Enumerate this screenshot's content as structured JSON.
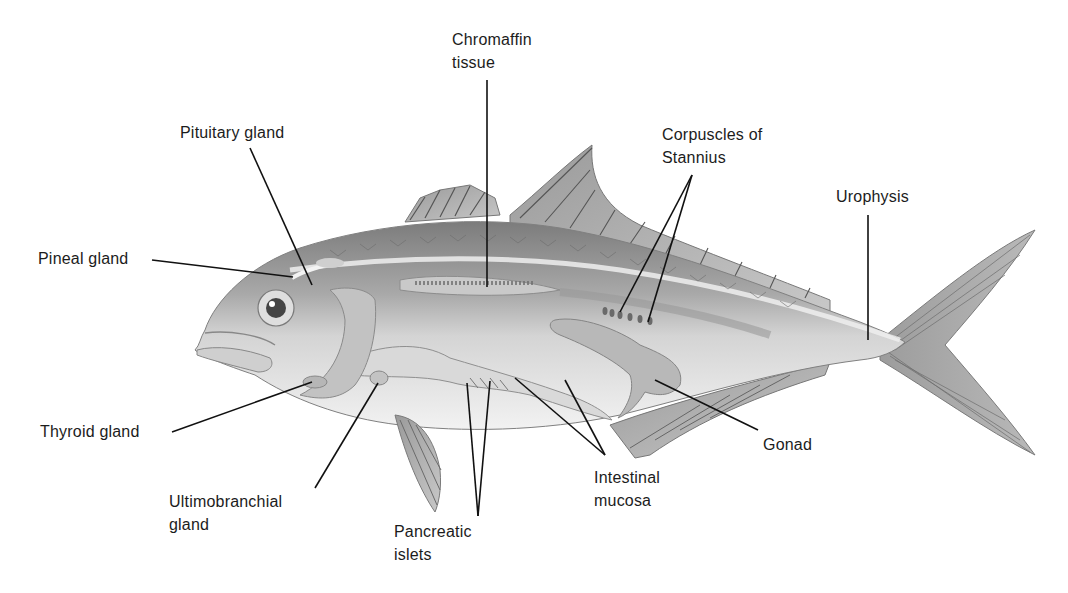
{
  "diagram": {
    "labels": {
      "chromaffin": "Chromaffin\ntissue",
      "pituitary": "Pituitary gland",
      "pineal": "Pineal gland",
      "corpuscles": "Corpuscles of\nStannius",
      "urophysis": "Urophysis",
      "thyroid": "Thyroid gland",
      "ultimobranchial": "Ultimobranchial\ngland",
      "pancreatic": "Pancreatic\nislets",
      "intestinal": "Intestinal\nmucosa",
      "gonad": "Gonad"
    },
    "colors": {
      "background": "#ffffff",
      "leader_line": "#111111",
      "body_dark": "#8a8a8a",
      "body_mid": "#b5b5b5",
      "body_light": "#e6e6e6",
      "fin": "#a8a8a8"
    }
  }
}
